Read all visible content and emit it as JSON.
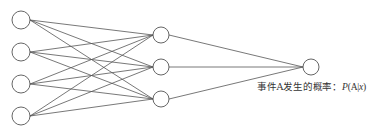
{
  "diagram": {
    "type": "neural-network",
    "layers": [
      {
        "name": "input",
        "x": 21,
        "nodes": [
          20,
          52,
          84,
          116
        ],
        "radius": 9
      },
      {
        "name": "hidden",
        "x": 161,
        "nodes": [
          35,
          67,
          99
        ],
        "radius": 8
      },
      {
        "name": "output",
        "x": 311,
        "nodes": [
          67
        ],
        "radius": 8
      }
    ],
    "stroke_color": "#555555",
    "fully_connected": true
  },
  "output_label": {
    "prefix": "事件A发生的概率：",
    "P": "P",
    "open": "(A|",
    "x": "x",
    "close": ")"
  }
}
